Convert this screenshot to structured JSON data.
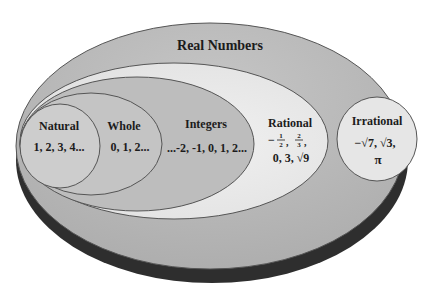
{
  "diagram": {
    "title": "Real Numbers",
    "sets": [
      {
        "name": "Natural",
        "examples": "1, 2, 3, 4..."
      },
      {
        "name": "Whole",
        "examples": "0, 1, 2..."
      },
      {
        "name": "Integers",
        "examples": "...-2, -1, 0, 1, 2..."
      },
      {
        "name": "Rational",
        "examples_line1_a_num": "1",
        "examples_line1_a_den": "2",
        "examples_line1_b_num": "2",
        "examples_line1_b_den": "3",
        "examples_line2": "0, 3,  √9"
      },
      {
        "name": "Irrational",
        "examples_line1": "−√7, √3,",
        "examples_line2": "π"
      }
    ],
    "colors": {
      "real": "#bdbdbd",
      "rational": "#e9e9e9",
      "integers": "#bcbcbc",
      "whole": "#c8c8c8",
      "natural": "#cfcfcf",
      "irrational": "#e6e6e6",
      "shadow": "#2e2e2e",
      "stroke": "#555555"
    }
  }
}
